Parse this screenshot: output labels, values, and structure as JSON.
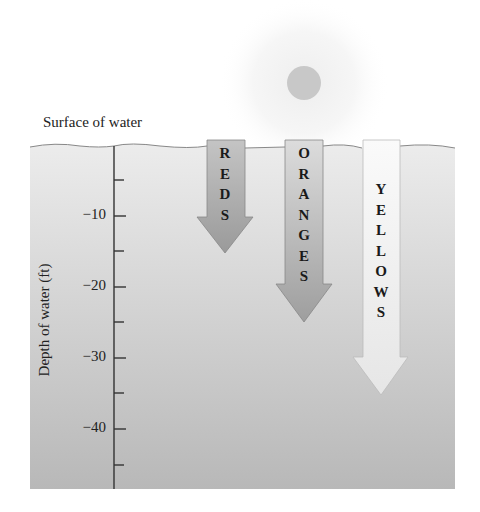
{
  "diagram": {
    "surface_label": "Surface of water",
    "axis_title": "Depth of water (ft)",
    "ticks": [
      {
        "label": "−10",
        "value": -10
      },
      {
        "label": "−20",
        "value": -20
      },
      {
        "label": "−30",
        "value": -30
      },
      {
        "label": "−40",
        "value": -40
      }
    ],
    "arrows": [
      {
        "label": "REDS",
        "penetration_ft": -11,
        "color": "#a9a9a9"
      },
      {
        "label": "ORANGES",
        "penetration_ft": -20,
        "color": "#b4b4b4"
      },
      {
        "label": "YELLOWS",
        "penetration_ft": -29,
        "color": "#f0f0f0"
      }
    ],
    "sun": {
      "color": "#c8c8c8"
    },
    "water_color_top": "#ececec",
    "water_color_bottom": "#b8b8b8"
  }
}
